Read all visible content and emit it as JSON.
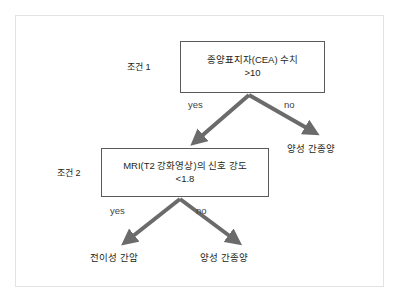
{
  "figure": {
    "type": "decision-tree",
    "colors": {
      "background": "#ffffff",
      "frame_border": "#e3e3e3",
      "box_border": "#59595b",
      "arrow": "#6b6b6b",
      "text": "#231f20"
    }
  },
  "conditions": [
    {
      "id": "condition-1",
      "label": "조건 1"
    },
    {
      "id": "condition-2",
      "label": "조건 2"
    }
  ],
  "decision_nodes": [
    {
      "id": "cea",
      "line1": "종양표지자(CEA) 수치",
      "line2": ">10"
    },
    {
      "id": "mri",
      "line1": "MRI(T2 강화영상)의 신호 강도",
      "line2": "<1.8"
    }
  ],
  "edges": [
    {
      "id": "cea-yes",
      "label": "yes",
      "from": "cea",
      "to": "mri"
    },
    {
      "id": "cea-no",
      "label": "no",
      "from": "cea",
      "to": "benign-1"
    },
    {
      "id": "mri-yes",
      "label": "yes",
      "from": "mri",
      "to": "metastatic"
    },
    {
      "id": "mri-no",
      "label": "no",
      "from": "mri",
      "to": "benign-2"
    }
  ],
  "leaf_nodes": [
    {
      "id": "benign-1",
      "label": "양성 간종양"
    },
    {
      "id": "metastatic",
      "label": "전이성 간암"
    },
    {
      "id": "benign-2",
      "label": "양성 간종양"
    }
  ]
}
